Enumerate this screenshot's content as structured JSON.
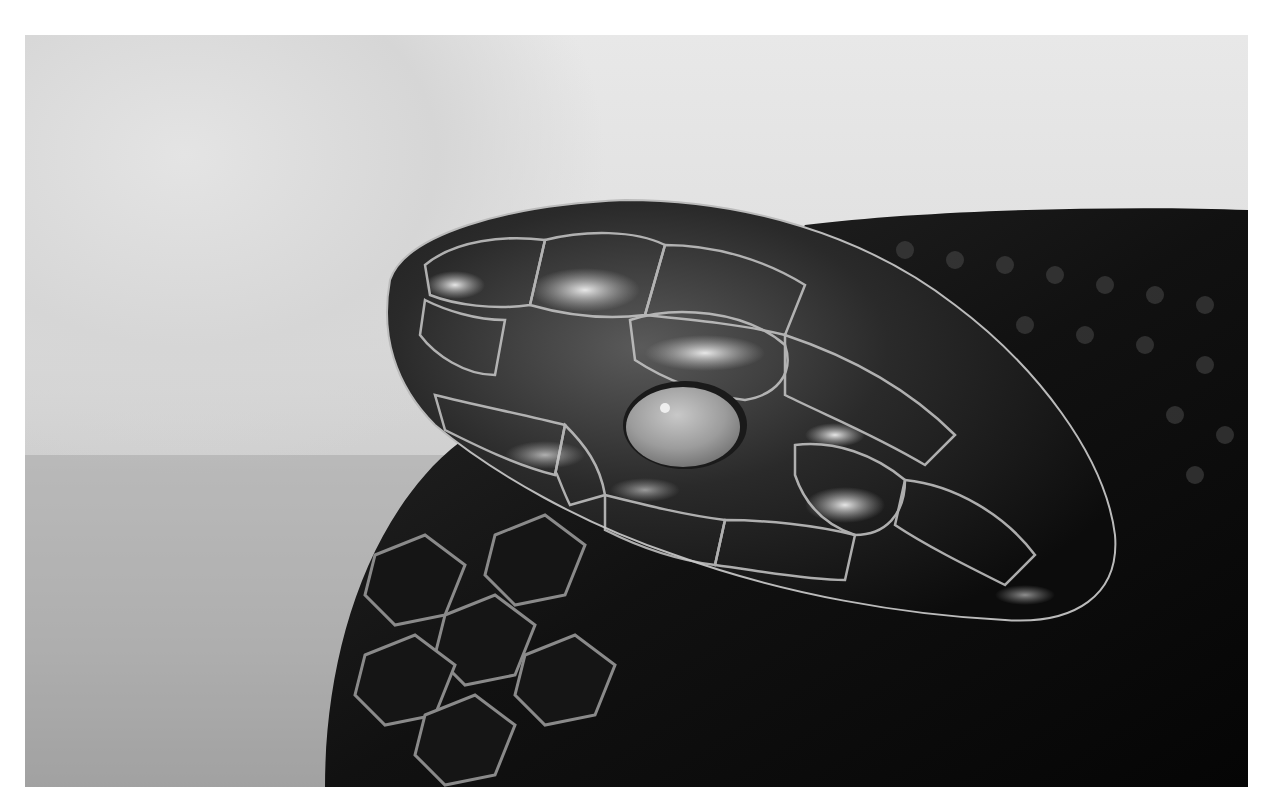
{
  "image": {
    "description": "Black-and-white close-up photograph of a snake's head with glossy scales and a pale eye",
    "subject": "snake head",
    "tone": "monochrome",
    "colors": {
      "background_light": "#e4e4e4",
      "background_mid": "#bdbdbd",
      "body_dark": "#0a0a0a",
      "scale_mid": "#3a3a3a",
      "highlight": "#d8d8d8",
      "eye": "#9a9a9a",
      "page": "#ffffff"
    }
  }
}
